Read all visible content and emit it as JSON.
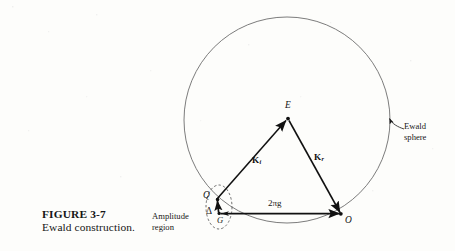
{
  "figure": {
    "caption_label": "FIGURE",
    "caption_number": "3-7",
    "caption_title": "Ewald construction.",
    "background_color": "#fdfdfb",
    "ink_color": "#1b1b1b"
  },
  "diagram": {
    "type": "ewald-sphere-construction",
    "sphere": {
      "label_line1": "Ewald",
      "label_line2": "sphere",
      "center_x": 287,
      "center_y": 120,
      "radius": 103,
      "stroke_color": "#6b6b6b",
      "stroke_width": 0.9
    },
    "points": [
      {
        "id": "E",
        "label": "E",
        "x": 288,
        "y": 118,
        "description": "Ewald sphere centre / scattering centre"
      },
      {
        "id": "Q",
        "label": "Q",
        "x": 218,
        "y": 197,
        "description": "reciprocal lattice point on sphere"
      },
      {
        "id": "G",
        "label": "G",
        "x": 219,
        "y": 213,
        "description": "reciprocal lattice vector terminus"
      },
      {
        "id": "O",
        "label": "O",
        "x": 341,
        "y": 214,
        "description": "reciprocal lattice origin"
      }
    ],
    "vectors": [
      {
        "id": "Ki",
        "symbol": "K",
        "subscript": "i",
        "from": "Q",
        "to": "E",
        "description": "incident wave vector"
      },
      {
        "id": "Kr",
        "symbol": "K",
        "subscript": "r",
        "from": "E",
        "to": "O",
        "description": "reflected wave vector"
      },
      {
        "id": "g",
        "symbol": "2",
        "greek": "π",
        "italic": "g",
        "text": "2πg",
        "from": "G",
        "to": "O",
        "description": "reciprocal lattice vector"
      },
      {
        "id": "delta",
        "symbol": "Δ",
        "from": "G",
        "to": "Q",
        "description": "deviation parameter"
      }
    ],
    "amplitude_region": {
      "label_line1": "Amplitude",
      "label_line2": "region",
      "ellipse_cx": 219,
      "ellipse_cy": 207,
      "ellipse_rx": 13,
      "ellipse_ry": 22,
      "stroke_style": "dashed"
    },
    "callout_arrow": {
      "description": "curved arrow from Ewald sphere label to the circle",
      "tip_x": 388,
      "tip_y": 117
    }
  }
}
